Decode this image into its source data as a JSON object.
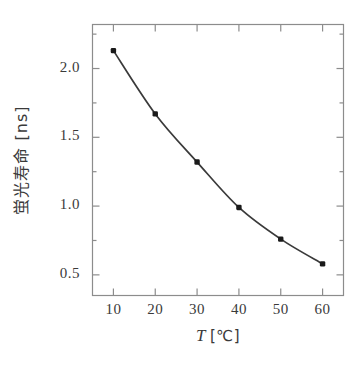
{
  "chart_data": {
    "type": "line",
    "title": "",
    "subtitle": "",
    "xlabel": "T",
    "xlabel_unit": "[℃]",
    "xlabel_full": "T [℃]",
    "ylabel": "蛍光寿命 [ns]",
    "x": [
      10,
      20,
      30,
      40,
      50,
      60
    ],
    "values": [
      2.13,
      1.67,
      1.32,
      0.99,
      0.76,
      0.58
    ],
    "series": [
      {
        "name": "fluorescence-lifetime",
        "values": [
          2.13,
          1.67,
          1.32,
          0.99,
          0.76,
          0.58
        ]
      }
    ],
    "xlim": [
      5,
      65
    ],
    "ylim": [
      0.35,
      2.32
    ],
    "xticks": [
      10,
      20,
      30,
      40,
      50,
      60
    ],
    "xtick_labels": [
      "10",
      "20",
      "30",
      "40",
      "50",
      "60"
    ],
    "yticks": [
      0.5,
      1.0,
      1.5,
      2.0
    ],
    "ytick_labels": [
      "0.5",
      "1.0",
      "1.5",
      "2.0"
    ],
    "yticks_minor": [
      0.75,
      1.25,
      1.75,
      2.25
    ],
    "grid": false,
    "legend": false,
    "legend_position": "none",
    "marker": "square-circle",
    "marker_color": "#1a1a1a",
    "line_color": "#3a3a3a",
    "frame_color": "#8c8c8c",
    "background": "#ffffff"
  },
  "figure": {
    "axis_title_x": "T",
    "axis_unit_x": "[℃]",
    "axis_title_y": "蛍光寿命 [ns]"
  }
}
